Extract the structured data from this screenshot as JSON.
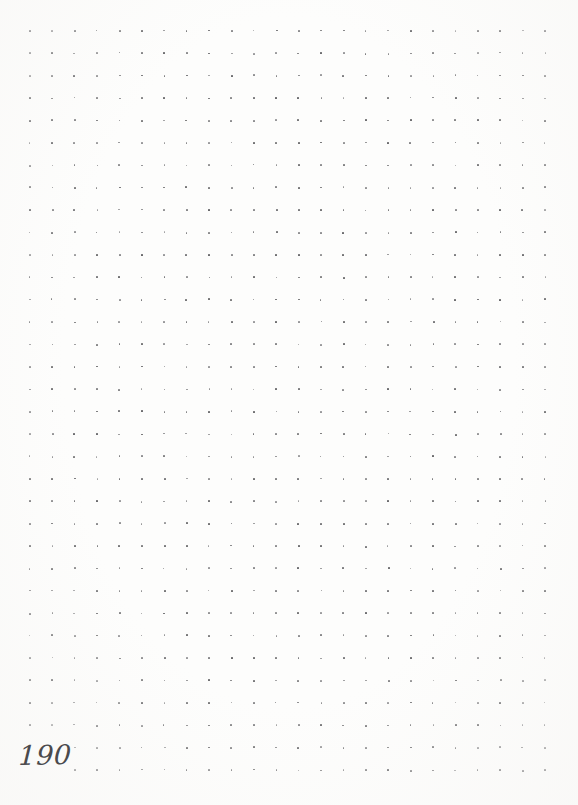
{
  "page": {
    "kind": "dotted-grid-notebook-page",
    "background_color": "#fdfdfc",
    "width": 578,
    "height": 805
  },
  "page_number": {
    "label": "190",
    "color": "#4a4a4d",
    "position": "bottom-left"
  },
  "grid": {
    "dot_color": "#565659",
    "dot_size_px": 1.7,
    "spacing_px": 22.4,
    "origin_x": 29,
    "origin_y": 30,
    "columns": 24,
    "rows": 34,
    "skipped_dots": [
      {
        "col": 0,
        "row": 32
      },
      {
        "col": 1,
        "row": 32
      },
      {
        "col": 0,
        "row": 33
      },
      {
        "col": 1,
        "row": 33
      }
    ]
  }
}
